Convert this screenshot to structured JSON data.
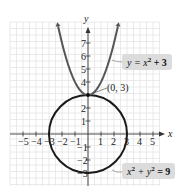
{
  "chart_data": {
    "type": "line",
    "title": "",
    "xlabel": "x",
    "ylabel": "y",
    "xlim": [
      -5.5,
      5.5
    ],
    "ylim": [
      -4,
      8
    ],
    "grid": true,
    "x_ticks": [
      -5,
      -4,
      -3,
      -2,
      -1,
      1,
      2,
      3,
      4,
      5
    ],
    "y_ticks": [
      -3,
      -2,
      -1,
      1,
      2,
      3,
      4,
      5,
      6,
      7
    ],
    "series": [
      {
        "name": "y = x² + 3",
        "kind": "parabola",
        "equation": "y = x^2 + 3",
        "x_range": [
          -2.3,
          2.3
        ]
      },
      {
        "name": "x² + y² = 9",
        "kind": "circle",
        "equation": "x^2 + y^2 = 9",
        "center": [
          0,
          0
        ],
        "radius": 3
      }
    ],
    "annotations": [
      {
        "text": "(0, 3)",
        "point": [
          0,
          3
        ]
      },
      {
        "text": "y = x² + 3",
        "target": "parabola"
      },
      {
        "text": "x² + y² = 9",
        "target": "circle"
      }
    ]
  },
  "labels": {
    "x_axis": "x",
    "y_axis": "y",
    "point": "(0, 3)",
    "parabola_eq_lhs": "y = x",
    "parabola_eq_exp": "2",
    "parabola_eq_rhs": " + 3",
    "circle_eq_x": "x",
    "circle_eq_exp1": "2",
    "circle_eq_mid": " + y",
    "circle_eq_exp2": "2",
    "circle_eq_rhs": " = 9"
  },
  "tick_labels": {
    "x": [
      "−5",
      "−4",
      "−3",
      "−2",
      "−1",
      "1",
      "2",
      "3",
      "4",
      "5"
    ],
    "y": [
      "7",
      "6",
      "5",
      "4",
      "2",
      "1",
      "−1",
      "−2",
      "−3"
    ]
  }
}
